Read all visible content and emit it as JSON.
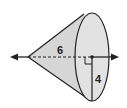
{
  "diagram": {
    "type": "cone",
    "labels": {
      "height": "6",
      "radius": "4"
    },
    "features": [
      "axis-of-rotation-with-arrows",
      "dashed-height-line",
      "right-angle-marker",
      "radius-segment",
      "elliptical-base"
    ],
    "colors": {
      "fill": "#d9d9d9",
      "stroke": "#222222",
      "background": "#ffffff"
    }
  }
}
